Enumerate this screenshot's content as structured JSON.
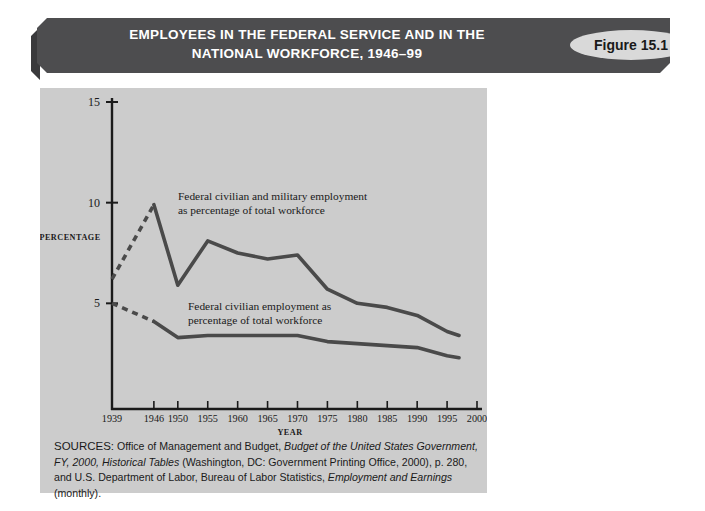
{
  "banner": {
    "title_line1": "EMPLOYEES IN THE FEDERAL SERVICE AND IN THE",
    "title_line2": "NATIONAL WORKFORCE, 1946–99",
    "figure_label": "Figure 15.1",
    "banner_color": "#4d4d4f",
    "badge_color": "#d9d9d9"
  },
  "panel": {
    "background_color": "#cccccc",
    "line_color": "#4a4a4a"
  },
  "sources": {
    "label": "SOURCES:",
    "text_part1": " Office of Management and Budget, ",
    "italic1": "Budget of the United States Government, FY, 2000,",
    "italic2": "Historical Tables",
    "text_part2": " (Washington, DC: Government Printing Office, 2000), p. 280, and U.S. Department of Labor, Bureau of Labor Statistics, ",
    "italic3": "Employment and Earnings",
    "text_part3": " (monthly)."
  },
  "chart_data": {
    "type": "line",
    "title": "EMPLOYEES IN THE FEDERAL SERVICE AND IN THE NATIONAL WORKFORCE, 1946–99",
    "xlabel": "YEAR",
    "ylabel": "PERCENTAGE",
    "xlim": [
      1939,
      2000
    ],
    "ylim": [
      0,
      15
    ],
    "yticks": [
      5,
      10,
      15
    ],
    "ytick_labels": [
      "5",
      "10",
      "15"
    ],
    "xticks": [
      1939,
      1946,
      1950,
      1955,
      1960,
      1965,
      1970,
      1975,
      1980,
      1985,
      1990,
      1995,
      2000
    ],
    "xtick_labels": [
      "1939",
      "1946",
      "1950",
      "1955",
      "1960",
      "1965",
      "1970",
      "1975",
      "1980",
      "1985",
      "1990",
      "1995",
      "2000"
    ],
    "grid": false,
    "legend_position": "inline-annotations",
    "series": [
      {
        "name": "Federal civilian and military employment as percentage of total workforce",
        "annotation_line1": "Federal civilian and military employment",
        "annotation_line2": "as percentage of total workforce",
        "color": "#4a4a4a",
        "dashed_segment": {
          "x": [
            1939,
            1946
          ],
          "y": [
            6.2,
            9.9
          ]
        },
        "x": [
          1946,
          1950,
          1955,
          1960,
          1965,
          1970,
          1975,
          1980,
          1985,
          1990,
          1995,
          1997
        ],
        "y": [
          9.9,
          5.9,
          8.1,
          7.5,
          7.2,
          7.4,
          5.7,
          5.0,
          4.8,
          4.4,
          3.6,
          3.4
        ]
      },
      {
        "name": "Federal civilian employment as percentage of total workforce",
        "annotation_line1": "Federal civilian employment as",
        "annotation_line2": "percentage of total workforce",
        "color": "#4a4a4a",
        "dashed_segment": {
          "x": [
            1939,
            1946
          ],
          "y": [
            5.0,
            4.1
          ]
        },
        "x": [
          1946,
          1950,
          1955,
          1960,
          1965,
          1970,
          1975,
          1980,
          1985,
          1990,
          1995,
          1997
        ],
        "y": [
          4.1,
          3.3,
          3.4,
          3.4,
          3.4,
          3.4,
          3.1,
          3.0,
          2.9,
          2.8,
          2.4,
          2.3
        ]
      }
    ]
  }
}
